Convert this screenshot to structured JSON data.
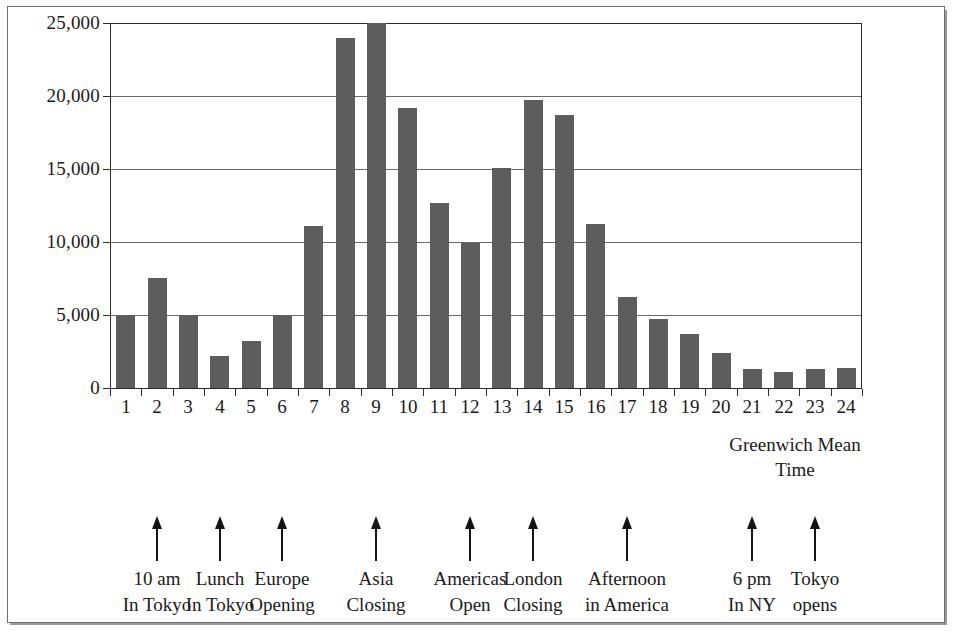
{
  "chart_data": {
    "type": "bar",
    "title": "",
    "subtitle": "",
    "xlabel": "Greenwich Mean Time",
    "ylabel": "",
    "grid": true,
    "legend": null,
    "xlim": [
      0.5,
      24.5
    ],
    "ylim": [
      0,
      25000
    ],
    "categories": [
      "1",
      "2",
      "3",
      "4",
      "5",
      "6",
      "7",
      "8",
      "9",
      "10",
      "11",
      "12",
      "13",
      "14",
      "15",
      "16",
      "17",
      "18",
      "19",
      "20",
      "21",
      "22",
      "23",
      "24"
    ],
    "values": [
      5000,
      7500,
      5000,
      2200,
      3200,
      5000,
      11100,
      24000,
      25000,
      19200,
      12700,
      9900,
      15100,
      19700,
      18700,
      11200,
      6200,
      4700,
      3700,
      2400,
      1300,
      1100,
      1300,
      1350
    ],
    "ytick_labels": [
      "0",
      "5,000",
      "10,000",
      "15,000",
      "20,000",
      "25,000"
    ],
    "ytick_values": [
      0,
      5000,
      10000,
      15000,
      20000,
      25000
    ],
    "xtick_labels": [
      "1",
      "2",
      "3",
      "4",
      "5",
      "6",
      "7",
      "8",
      "9",
      "10",
      "11",
      "12",
      "13",
      "14",
      "15",
      "16",
      "17",
      "18",
      "19",
      "20",
      "21",
      "22",
      "23",
      "24"
    ],
    "bar_color": "#5d5d5d",
    "axis_color": "#2b2b2b",
    "grid_color": "#6a6a6a",
    "annotations": [
      {
        "hour": 2,
        "line1": "10 am",
        "line2": "In Tokyo"
      },
      {
        "hour": 4,
        "line1": "Lunch",
        "line2": "In Tokyo"
      },
      {
        "hour": 6,
        "line1": "Europe",
        "line2": "Opening"
      },
      {
        "hour": 9,
        "line1": "Asia",
        "line2": "Closing"
      },
      {
        "hour": 12,
        "line1": "Americas",
        "line2": "Open"
      },
      {
        "hour": 14,
        "line1": "London",
        "line2": "Closing"
      },
      {
        "hour": 17,
        "line1": "Afternoon",
        "line2": "in America"
      },
      {
        "hour": 21,
        "line1": "6 pm",
        "line2": "In NY"
      },
      {
        "hour": 23,
        "line1": "Tokyo",
        "line2": "opens"
      }
    ]
  },
  "caption": {
    "gmt_line1": "Greenwich Mean",
    "gmt_line2": "Time"
  }
}
